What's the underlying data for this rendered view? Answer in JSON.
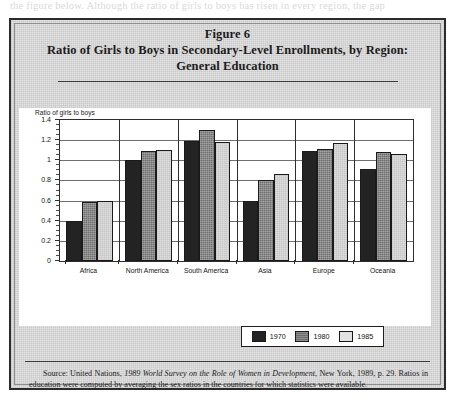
{
  "page_bleed_text": "the figure below. Although the ratio of girls to boys has risen in every region, the gap",
  "figure": {
    "label": "Figure 6",
    "title_line_1": "Ratio of Girls to Boys in Secondary-Level Enrollments, by Region:",
    "title_line_2": "General Education"
  },
  "source_note": {
    "prefix": "Source: United Nations, ",
    "italic_title": "1989 World Survey on the Role of Women in Development",
    "suffix": ", New York, 1989, p. 29. Ratios in education were computed by averaging the sex ratios in the countries for which statistics were available."
  },
  "colors": {
    "series_1970": "#232323",
    "series_1980": "#6e6e6e",
    "series_1985": "#dcdcdc",
    "frame": "#2b2b2b",
    "paper": "#e2e2e2",
    "plot_background": "#ffffff"
  },
  "chart_data": {
    "type": "bar",
    "title": "Ratio of Girls to Boys in Secondary-Level Enrollments, by Region: General Education",
    "subtitle": "Figure 6",
    "xlabel": "",
    "ylabel": "Ratio of girls to boys",
    "ylim": [
      0,
      1.4
    ],
    "ytick_step": 0.2,
    "yticks": [
      "0",
      "0.2",
      "0.4",
      "0.6",
      "0.8",
      "1",
      "1.2",
      "1.4"
    ],
    "ytick_values": [
      0,
      0.2,
      0.4,
      0.6,
      0.8,
      1.0,
      1.2,
      1.4
    ],
    "grid": true,
    "grid_axis": "y",
    "legend_position": "bottom-right",
    "categories": [
      "Africa",
      "North America",
      "South America",
      "Asia",
      "Europe",
      "Oceania"
    ],
    "series": [
      {
        "name": "1970",
        "color": "#232323",
        "values": [
          0.4,
          1.0,
          1.19,
          0.6,
          1.09,
          0.91
        ]
      },
      {
        "name": "1980",
        "color": "#6e6e6e",
        "values": [
          0.59,
          1.09,
          1.3,
          0.8,
          1.11,
          1.08
        ]
      },
      {
        "name": "1985",
        "color": "#dcdcdc",
        "values": [
          0.6,
          1.1,
          1.18,
          0.86,
          1.17,
          1.06
        ]
      }
    ]
  }
}
